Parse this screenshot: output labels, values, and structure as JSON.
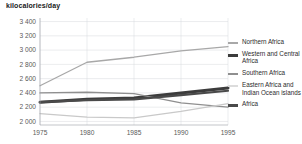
{
  "chart_data": {
    "type": "line",
    "title": "kilocalories/day",
    "xlabel": "",
    "ylabel": "kilocalories/day",
    "x": [
      1975,
      1980,
      1985,
      1990,
      1995
    ],
    "xtick_labels": [
      "1975",
      "1980",
      "1985",
      "1990",
      "1995"
    ],
    "ytick_labels": [
      "2 000",
      "2 200",
      "2 400",
      "2 600",
      "2 800",
      "3 000",
      "3 200",
      "3 400"
    ],
    "ytick_values": [
      2000,
      2200,
      2400,
      2600,
      2800,
      3000,
      3200,
      3400
    ],
    "xlim": [
      1975,
      1995
    ],
    "ylim": [
      1950,
      3450
    ],
    "grid": true,
    "legend_position": "right",
    "series": [
      {
        "name": "Northern Africa",
        "color": "#a8a8a8",
        "width": 1.3,
        "values": [
          2500,
          2830,
          2900,
          2990,
          3050
        ]
      },
      {
        "name": "Western and Central Africa",
        "color": "#3c3c3c",
        "width": 3.0,
        "values": [
          2270,
          2310,
          2330,
          2400,
          2470
        ]
      },
      {
        "name": "Southern Africa",
        "color": "#8f8f8f",
        "width": 1.4,
        "values": [
          2400,
          2410,
          2390,
          2260,
          2200
        ]
      },
      {
        "name": "Eastern Africa and Indian Ocean islands",
        "color": "#c9c9c9",
        "width": 1.3,
        "values": [
          2110,
          2060,
          2050,
          2140,
          2250
        ]
      },
      {
        "name": "Africa",
        "color": "#4a4a4a",
        "width": 2.2,
        "values": [
          2270,
          2300,
          2310,
          2370,
          2430
        ]
      }
    ]
  },
  "legend": {
    "items": [
      {
        "label": "Northern Africa",
        "color": "#a8a8a8",
        "thickness": "1.5px"
      },
      {
        "label": "Western and Central Africa",
        "color": "#3c3c3c",
        "thickness": "3px"
      },
      {
        "label": "Southern Africa",
        "color": "#8f8f8f",
        "thickness": "1.5px"
      },
      {
        "label": "Eastern Africa and Indian Ocean islands",
        "color": "#dcdcdc",
        "thickness": "1.5px"
      },
      {
        "label": "Africa",
        "color": "#4a4a4a",
        "thickness": "3px"
      }
    ]
  }
}
